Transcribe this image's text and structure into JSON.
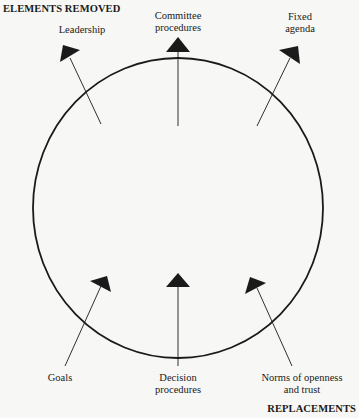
{
  "diagram": {
    "top_heading": "ELEMENTS REMOVED",
    "bottom_heading": "REPLACEMENTS",
    "removed": [
      {
        "lines": [
          "Leadership"
        ]
      },
      {
        "lines": [
          "Committee",
          "procedures"
        ]
      },
      {
        "lines": [
          "Fixed",
          "agenda"
        ]
      }
    ],
    "replacements": [
      {
        "lines": [
          "Goals"
        ]
      },
      {
        "lines": [
          "Decision",
          "procedures"
        ]
      },
      {
        "lines": [
          "Norms of openness",
          "and trust"
        ]
      }
    ],
    "colors": {
      "background": "#f7f7f5",
      "ink": "#1a1a1a"
    }
  }
}
